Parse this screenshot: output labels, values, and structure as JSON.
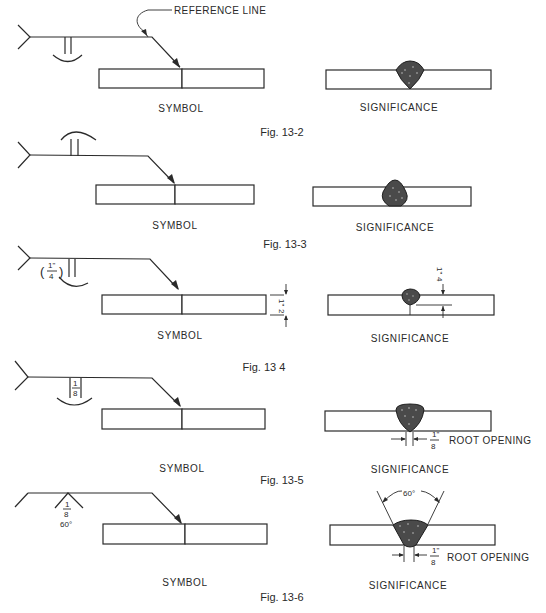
{
  "labels": {
    "reference_line": "REFERENCE LINE",
    "symbol": "SYMBOL",
    "significance": "SIGNIFICANCE",
    "root_opening": "ROOT OPENING"
  },
  "figures": [
    {
      "id": "fig-13-2",
      "caption": "Fig. 13-2",
      "description": "Square-groove weld symbol below reference line (arrow side), melt-through contour"
    },
    {
      "id": "fig-13-3",
      "caption": "Fig. 13-3",
      "description": "Square-groove weld symbol above reference line (other side)"
    },
    {
      "id": "fig-13-4",
      "caption": "Fig. 13 4",
      "size_label": "(1/4\")",
      "plate_thickness": "1/2\"",
      "penetration": "1/4\""
    },
    {
      "id": "fig-13-5",
      "caption": "Fig. 13-5",
      "root_opening_symbol": "1/8",
      "root_opening_value": "1/8\""
    },
    {
      "id": "fig-13-6",
      "caption": "Fig. 13-6",
      "root_opening_symbol": "1/8",
      "groove_angle": "60°",
      "groove_angle_sig": "60°",
      "root_opening_value": "1/8\""
    }
  ],
  "fractions": {
    "quarter_num": "1\"",
    "quarter_den": "4",
    "half_num": "1\"",
    "half_den": "2",
    "eighth_num": "1",
    "eighth_den": "8",
    "eighth_in_num": "1\"",
    "eighth_in_den": "8",
    "angle": "60°"
  }
}
